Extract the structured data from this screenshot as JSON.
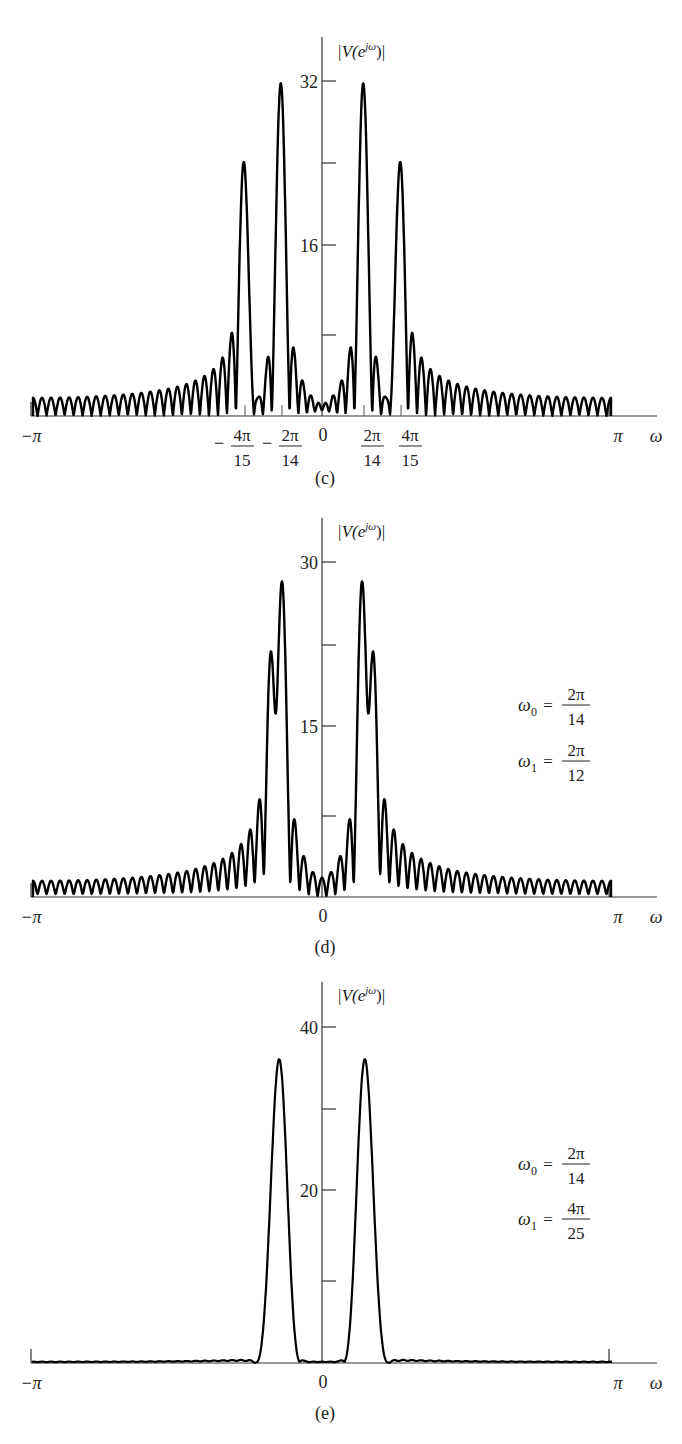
{
  "chart_data": [
    {
      "type": "line",
      "panel_label": "(c)",
      "ylabel": "|V(e^{jω})|",
      "xlabel": "ω",
      "xlim": [
        "−π",
        "π"
      ],
      "x_tick_labels": [
        "−π",
        "−4π/15",
        "−2π/14",
        "0",
        "2π/14",
        "4π/15",
        "π"
      ],
      "y_tick_labels": [
        "16",
        "32"
      ],
      "y_ticks": [
        8,
        16,
        24,
        32
      ],
      "ylim": [
        0,
        37
      ],
      "params": {
        "N": 64,
        "window": "rectangular",
        "A0": 1,
        "A1": 0.75,
        "omega0": "2π/14",
        "omega1": "4π/15"
      },
      "peaks": [
        {
          "x": "−4π/15",
          "y": 24
        },
        {
          "x": "−2π/14",
          "y": 32
        },
        {
          "x": "2π/14",
          "y": 32
        },
        {
          "x": "4π/15",
          "y": 24
        }
      ]
    },
    {
      "type": "line",
      "panel_label": "(d)",
      "ylabel": "|V(e^{jω})|",
      "xlabel": "ω",
      "xlim": [
        "−π",
        "π"
      ],
      "x_tick_labels": [
        "−π",
        "0",
        "π"
      ],
      "y_tick_labels": [
        "15",
        "30"
      ],
      "y_ticks": [
        7.5,
        15,
        22.5,
        30
      ],
      "ylim": [
        0,
        34
      ],
      "annotation": [
        "ω0 = 2π/14",
        "ω1 = 2π/12"
      ],
      "params": {
        "N": 64,
        "window": "rectangular",
        "A0": 1,
        "A1": 0.75,
        "omega0": "2π/14",
        "omega1": "2π/12"
      },
      "peaks": [
        {
          "x": "≈−2π/13.3",
          "y": 22.5
        },
        {
          "x": "≈−2π/14",
          "y": 28.5
        },
        {
          "x": "≈2π/14",
          "y": 28.5
        },
        {
          "x": "≈2π/13.3",
          "y": 22.5
        }
      ]
    },
    {
      "type": "line",
      "panel_label": "(e)",
      "ylabel": "|V(e^{jω})|",
      "xlabel": "ω",
      "xlim": [
        "−π",
        "π"
      ],
      "x_tick_labels": [
        "−π",
        "0",
        "π"
      ],
      "y_tick_labels": [
        "20",
        "40"
      ],
      "y_ticks": [
        10,
        20,
        30,
        40
      ],
      "ylim": [
        0,
        45
      ],
      "annotation": [
        "ω0 = 2π/14",
        "ω1 = 4π/25"
      ],
      "params": {
        "N": 64,
        "window": "tapered",
        "A0": 1,
        "A1": 0.75,
        "omega0": "2π/14",
        "omega1": "4π/25"
      },
      "peaks": [
        {
          "x": "≈−0.47",
          "y": 34
        },
        {
          "x": "≈0.47",
          "y": 34
        }
      ]
    }
  ],
  "panels": {
    "c": {
      "label": "(c)",
      "ylabel_main": "|V(e",
      "ylabel_sup": "jω",
      "ylabel_end": ")|",
      "yticks": {
        "t32": "32",
        "t16": "16"
      },
      "xticks": {
        "neg_pi": "−π",
        "pi": "π",
        "omega": "ω",
        "zero": "0",
        "n4pi15_num": "4π",
        "n4pi15_den": "15",
        "n2pi14_num": "2π",
        "n2pi14_den": "14",
        "p2pi14_num": "2π",
        "p2pi14_den": "14",
        "p4pi15_num": "4π",
        "p4pi15_den": "15",
        "minus": "−"
      }
    },
    "d": {
      "label": "(d)",
      "ylabel_main": "|V(e",
      "ylabel_sup": "jω",
      "ylabel_end": ")|",
      "yticks": {
        "t30": "30",
        "t15": "15"
      },
      "xticks": {
        "neg_pi": "−π",
        "pi": "π",
        "omega": "ω",
        "zero": "0"
      },
      "annotation": {
        "w0_sym": "ω",
        "w0_sub": "0",
        "w0_eq": "=",
        "w0_num": "2π",
        "w0_den": "14",
        "w1_sym": "ω",
        "w1_sub": "1",
        "w1_eq": "=",
        "w1_num": "2π",
        "w1_den": "12"
      }
    },
    "e": {
      "label": "(e)",
      "ylabel_main": "|V(e",
      "ylabel_sup": "jω",
      "ylabel_end": ")|",
      "yticks": {
        "t40": "40",
        "t20": "20"
      },
      "xticks": {
        "neg_pi": "−π",
        "pi": "π",
        "omega": "ω",
        "zero": "0"
      },
      "annotation": {
        "w0_sym": "ω",
        "w0_sub": "0",
        "w0_eq": "=",
        "w0_num": "2π",
        "w0_den": "14",
        "w1_sym": "ω",
        "w1_sub": "1",
        "w1_eq": "=",
        "w1_num": "4π",
        "w1_den": "25"
      }
    }
  },
  "colors": {
    "curve": "#000000",
    "axis": "#333333",
    "text": "#222222"
  }
}
